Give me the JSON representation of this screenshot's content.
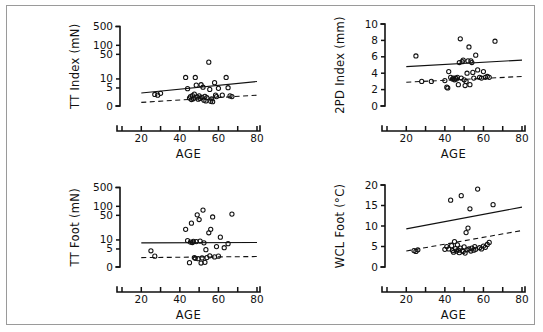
{
  "figure": {
    "title_visible": false,
    "panel_count": 4,
    "border_color": "#9a9a9a",
    "background": "#ffffff",
    "marker_style": "open-circle",
    "line_styles": [
      "solid",
      "dashed"
    ]
  },
  "chart_data": [
    {
      "id": "tt-index",
      "type": "scatter",
      "title": "",
      "xlabel": "AGE",
      "ylabel": "TT Index (mN)",
      "xlim": [
        10,
        80
      ],
      "ylim": [
        0,
        500
      ],
      "grid": false,
      "legend": null,
      "y_scale": "custom-compressed",
      "xticks": [
        10,
        20,
        30,
        40,
        50,
        60,
        70,
        80
      ],
      "xticklabels": [
        "",
        "20",
        "",
        "40",
        "",
        "60",
        "",
        "80"
      ],
      "yticks": [
        0,
        5,
        10,
        50,
        100,
        500
      ],
      "yticklabels": [
        "0",
        "5",
        "10",
        "50",
        "100",
        "500"
      ],
      "points": [
        [
          27,
          3.2
        ],
        [
          28.5,
          3.0
        ],
        [
          30,
          3.5
        ],
        [
          43,
          11
        ],
        [
          44,
          4.8
        ],
        [
          45,
          2.2
        ],
        [
          45.5,
          2.6
        ],
        [
          46,
          1.8
        ],
        [
          46.5,
          2.9
        ],
        [
          47,
          2.0
        ],
        [
          47.5,
          3.3
        ],
        [
          48,
          11
        ],
        [
          48.5,
          6.2
        ],
        [
          49,
          2.5
        ],
        [
          49.5,
          1.9
        ],
        [
          50,
          2.8
        ],
        [
          50.5,
          2.1
        ],
        [
          51,
          6.4
        ],
        [
          51.5,
          2.4
        ],
        [
          52,
          5.3
        ],
        [
          52.5,
          1.6
        ],
        [
          53,
          2.7
        ],
        [
          53.5,
          1.4
        ],
        [
          54,
          2.3
        ],
        [
          55,
          30
        ],
        [
          55.5,
          4.6
        ],
        [
          56,
          1.3
        ],
        [
          56.5,
          2.0
        ],
        [
          57,
          1.2
        ],
        [
          58,
          7.5
        ],
        [
          58.5,
          3.0
        ],
        [
          59,
          2.6
        ],
        [
          60,
          4.9
        ],
        [
          62,
          3.0
        ],
        [
          64,
          11
        ],
        [
          65,
          5.1
        ],
        [
          66,
          2.8
        ],
        [
          67,
          2.6
        ]
      ],
      "fit_lines": [
        {
          "style": "solid",
          "x": [
            20,
            80
          ],
          "y": [
            3.6,
            8.2
          ]
        },
        {
          "style": "dashed",
          "x": [
            20,
            80
          ],
          "y": [
            1.0,
            3.0
          ]
        }
      ]
    },
    {
      "id": "2pd-index",
      "type": "scatter",
      "title": "",
      "xlabel": "AGE",
      "ylabel": "2PD Index (mm)",
      "xlim": [
        10,
        80
      ],
      "ylim": [
        0,
        10
      ],
      "grid": false,
      "legend": null,
      "y_scale": "linear",
      "xticks": [
        10,
        20,
        30,
        40,
        50,
        60,
        70,
        80
      ],
      "xticklabels": [
        "",
        "20",
        "",
        "40",
        "",
        "60",
        "",
        "80"
      ],
      "yticks": [
        0,
        2,
        4,
        6,
        8,
        10
      ],
      "yticklabels": [
        "0",
        "2",
        "4",
        "6",
        "8",
        "10"
      ],
      "points": [
        [
          25,
          6.1
        ],
        [
          28,
          3.0
        ],
        [
          33,
          3.0
        ],
        [
          40,
          3.1
        ],
        [
          41,
          2.3
        ],
        [
          41.5,
          2.2
        ],
        [
          42,
          4.2
        ],
        [
          43,
          3.5
        ],
        [
          44,
          3.3
        ],
        [
          44.5,
          3.4
        ],
        [
          45,
          3.2
        ],
        [
          45.5,
          3.4
        ],
        [
          46,
          3.3
        ],
        [
          46.5,
          3.5
        ],
        [
          47,
          2.6
        ],
        [
          47.5,
          5.3
        ],
        [
          48,
          8.2
        ],
        [
          48.5,
          3.4
        ],
        [
          49,
          5.4
        ],
        [
          49.5,
          5.6
        ],
        [
          50,
          3.2
        ],
        [
          50.5,
          2.5
        ],
        [
          51,
          3.0
        ],
        [
          51.5,
          4.0
        ],
        [
          52,
          5.5
        ],
        [
          52.5,
          7.2
        ],
        [
          53,
          2.6
        ],
        [
          53.5,
          5.5
        ],
        [
          54,
          5.3
        ],
        [
          54.5,
          4.1
        ],
        [
          55,
          3.4
        ],
        [
          56,
          6.2
        ],
        [
          57,
          4.4
        ],
        [
          58,
          3.5
        ],
        [
          59,
          3.4
        ],
        [
          60,
          4.2
        ],
        [
          61,
          3.5
        ],
        [
          62,
          3.6
        ],
        [
          63,
          3.5
        ],
        [
          66,
          7.9
        ]
      ],
      "fit_lines": [
        {
          "style": "solid",
          "x": [
            20,
            80
          ],
          "y": [
            4.8,
            5.6
          ]
        },
        {
          "style": "dashed",
          "x": [
            20,
            80
          ],
          "y": [
            2.9,
            3.6
          ]
        }
      ]
    },
    {
      "id": "tt-foot",
      "type": "scatter",
      "title": "",
      "xlabel": "AGE",
      "ylabel": "TT Foot (mN)",
      "xlim": [
        10,
        80
      ],
      "ylim": [
        0,
        500
      ],
      "grid": false,
      "legend": null,
      "y_scale": "custom-compressed",
      "xticks": [
        10,
        20,
        30,
        40,
        50,
        60,
        70,
        80
      ],
      "xticklabels": [
        "",
        "20",
        "",
        "40",
        "",
        "60",
        "",
        "80"
      ],
      "yticks": [
        0,
        5,
        10,
        50,
        100,
        500
      ],
      "yticklabels": [
        "0",
        "5",
        "10",
        "50",
        "100",
        "500"
      ],
      "points": [
        [
          25,
          4.5
        ],
        [
          27,
          3.0
        ],
        [
          43,
          20
        ],
        [
          44,
          9.5
        ],
        [
          45,
          1.2
        ],
        [
          45.5,
          8.5
        ],
        [
          46,
          30
        ],
        [
          46.5,
          8.2
        ],
        [
          47,
          9.0
        ],
        [
          47.5,
          2.6
        ],
        [
          48,
          2.4
        ],
        [
          48.5,
          8.8
        ],
        [
          49,
          52
        ],
        [
          49.5,
          2.3
        ],
        [
          50,
          38
        ],
        [
          50.5,
          9.2
        ],
        [
          51,
          1.1
        ],
        [
          51.5,
          2.5
        ],
        [
          52,
          75
        ],
        [
          52.5,
          8.0
        ],
        [
          53,
          1.3
        ],
        [
          53.5,
          4.8
        ],
        [
          54,
          2.6
        ],
        [
          55,
          16
        ],
        [
          55.5,
          3.1
        ],
        [
          56,
          20
        ],
        [
          57,
          45
        ],
        [
          58,
          2.8
        ],
        [
          59,
          6.0
        ],
        [
          60,
          3.0
        ],
        [
          61,
          12
        ],
        [
          63,
          5.5
        ],
        [
          65,
          7.5
        ],
        [
          67,
          55
        ]
      ],
      "fit_lines": [
        {
          "style": "solid",
          "x": [
            20,
            80
          ],
          "y": [
            8.0,
            8.2
          ]
        },
        {
          "style": "dashed",
          "x": [
            20,
            80
          ],
          "y": [
            2.6,
            2.9
          ]
        }
      ]
    },
    {
      "id": "wcl-foot",
      "type": "scatter",
      "title": "",
      "xlabel": "AGE",
      "ylabel": "WCL Foot (°C)",
      "xlim": [
        10,
        80
      ],
      "ylim": [
        0,
        20
      ],
      "grid": false,
      "legend": null,
      "y_scale": "linear",
      "xticks": [
        10,
        20,
        30,
        40,
        50,
        60,
        70,
        80
      ],
      "xticklabels": [
        "",
        "20",
        "",
        "40",
        "",
        "60",
        "",
        "80"
      ],
      "yticks": [
        0,
        5,
        10,
        15,
        20
      ],
      "yticklabels": [
        "0",
        "5",
        "10",
        "15",
        "20"
      ],
      "points": [
        [
          24,
          4.0
        ],
        [
          25,
          3.8
        ],
        [
          26,
          4.2
        ],
        [
          40,
          4.3
        ],
        [
          41,
          5.0
        ],
        [
          42,
          4.4
        ],
        [
          43,
          16.3
        ],
        [
          43.5,
          5.2
        ],
        [
          44,
          4.0
        ],
        [
          44.5,
          3.6
        ],
        [
          45,
          6.2
        ],
        [
          45.5,
          4.5
        ],
        [
          46,
          3.9
        ],
        [
          46.5,
          5.4
        ],
        [
          47,
          4.1
        ],
        [
          47.5,
          3.5
        ],
        [
          48,
          4.6
        ],
        [
          48.5,
          17.4
        ],
        [
          49,
          4.0
        ],
        [
          49.5,
          3.8
        ],
        [
          50,
          4.9
        ],
        [
          50.5,
          3.4
        ],
        [
          51,
          8.4
        ],
        [
          51.5,
          4.2
        ],
        [
          52,
          9.5
        ],
        [
          52.5,
          4.4
        ],
        [
          53,
          14.2
        ],
        [
          53.5,
          3.9
        ],
        [
          54,
          4.6
        ],
        [
          55,
          4.1
        ],
        [
          55.5,
          5.0
        ],
        [
          56,
          4.3
        ],
        [
          57,
          19.0
        ],
        [
          58,
          4.7
        ],
        [
          59,
          4.4
        ],
        [
          60,
          5.1
        ],
        [
          61,
          4.8
        ],
        [
          62,
          5.5
        ],
        [
          63,
          6.0
        ],
        [
          65,
          15.2
        ]
      ],
      "fit_lines": [
        {
          "style": "solid",
          "x": [
            20,
            80
          ],
          "y": [
            9.3,
            14.6
          ]
        },
        {
          "style": "dashed",
          "x": [
            20,
            80
          ],
          "y": [
            3.9,
            8.9
          ]
        }
      ]
    }
  ]
}
